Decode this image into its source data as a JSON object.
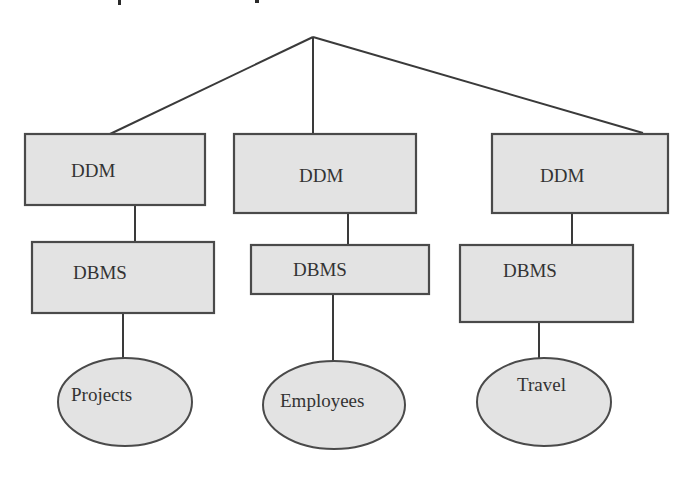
{
  "diagram": {
    "type": "tree",
    "root": {
      "label": ""
    },
    "columns": [
      {
        "id": "left",
        "ddm_label": "DDM",
        "dbms_label": "DBMS",
        "database_label": "Projects"
      },
      {
        "id": "middle",
        "ddm_label": "DDM",
        "dbms_label": "DBMS",
        "database_label": "Employees"
      },
      {
        "id": "right",
        "ddm_label": "DDM",
        "dbms_label": "DBMS",
        "database_label": "Travel"
      }
    ],
    "colors": {
      "node_fill": "#e3e3e3",
      "node_stroke": "#4a4a4a",
      "edge": "#3a3a3a",
      "text": "#333333"
    }
  }
}
